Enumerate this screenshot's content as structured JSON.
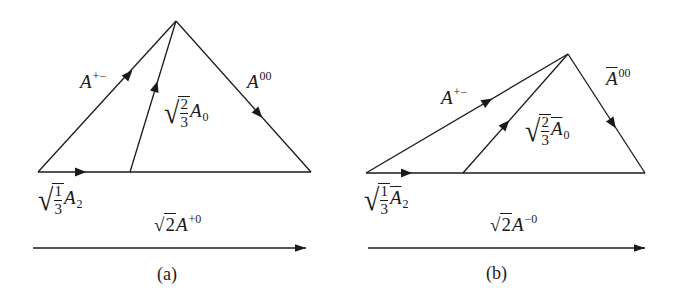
{
  "figure": {
    "panels": [
      {
        "id": "a",
        "caption": "(a)",
        "labels": {
          "left_edge": {
            "base": "A",
            "sup": "+−"
          },
          "right_edge": {
            "base": "A",
            "sup": "00",
            "bar": false
          },
          "middle_edge": {
            "coef_num": "2",
            "coef_den": "3",
            "base": "A",
            "sub": "0",
            "bar": false
          },
          "base_edge": {
            "coef_num": "1",
            "coef_den": "3",
            "base": "A",
            "sub": "2",
            "bar": false
          },
          "lower_arrow": {
            "coef": "2",
            "base": "A",
            "sup": "+0"
          }
        }
      },
      {
        "id": "b",
        "caption": "(b)",
        "labels": {
          "left_edge": {
            "base": "A",
            "sup": "+−"
          },
          "right_edge": {
            "base": "A",
            "sup": "00",
            "bar": true
          },
          "middle_edge": {
            "coef_num": "2",
            "coef_den": "3",
            "base": "A",
            "sub": "0",
            "bar": true
          },
          "base_edge": {
            "coef_num": "1",
            "coef_den": "3",
            "base": "A",
            "sub": "2",
            "bar": true
          },
          "lower_arrow": {
            "coef": "2",
            "base": "A",
            "sup": "−0"
          }
        }
      }
    ],
    "colors": {
      "stroke": "#1a1a1a",
      "background": "#ffffff"
    }
  }
}
